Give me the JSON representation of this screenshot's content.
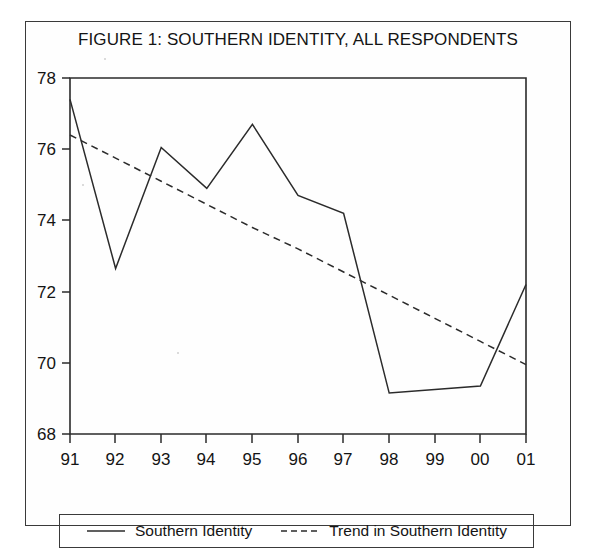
{
  "figure": {
    "title": "FIGURE 1: SOUTHERN IDENTITY, ALL RESPONDENTS"
  },
  "legend": {
    "entries": [
      {
        "label": "Southern Identity",
        "style": "solid",
        "icon": "solid-line-icon",
        "color": "#2b2b2b"
      },
      {
        "label": "Trend in Southern Identity",
        "style": "dashed",
        "icon": "dashed-line-icon",
        "color": "#2b2b2b"
      }
    ]
  },
  "chart_data": {
    "type": "line",
    "title": "FIGURE 1: SOUTHERN IDENTITY, ALL RESPONDENTS",
    "xlabel": "",
    "ylabel": "",
    "categories": [
      "91",
      "92",
      "93",
      "94",
      "95",
      "96",
      "97",
      "98",
      "99",
      "00",
      "01"
    ],
    "x_tick_labels": [
      "91",
      "92",
      "93",
      "94",
      "95",
      "96",
      "97",
      "98",
      "99",
      "00",
      "01"
    ],
    "y_tick_labels": [
      "68",
      "70",
      "72",
      "74",
      "76",
      "78"
    ],
    "y_ticks": [
      68,
      70,
      72,
      74,
      76,
      78
    ],
    "ylim": [
      68,
      78
    ],
    "xlim": [
      "91",
      "01"
    ],
    "grid": false,
    "legend_position": "bottom",
    "series": [
      {
        "name": "Southern Identity",
        "style": "solid",
        "color": "#2b2b2b",
        "values": [
          77.4,
          72.65,
          76.05,
          74.9,
          76.7,
          74.7,
          74.2,
          69.15,
          69.25,
          69.35,
          72.2
        ]
      },
      {
        "name": "Trend in Southern Identity",
        "style": "dashed",
        "color": "#2b2b2b",
        "values": [
          76.4,
          75.75,
          75.1,
          74.45,
          73.8,
          73.2,
          72.55,
          71.9,
          71.25,
          70.6,
          69.95
        ]
      }
    ]
  }
}
